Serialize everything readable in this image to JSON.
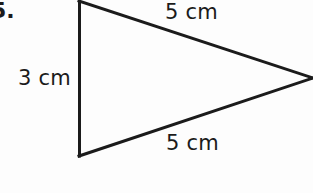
{
  "page": {
    "background_color": "#fdfdfd",
    "ink_color": "#1b1b1b"
  },
  "problem": {
    "number_label": "5.",
    "clipped_at_left_edge": true
  },
  "figure": {
    "shape_name": "triangle",
    "stroke_color": "#1b1b1b",
    "stroke_width": 3,
    "fill": "none",
    "vertices": {
      "top_left": {
        "x": 79,
        "y": 1
      },
      "bottom_left": {
        "x": 79,
        "y": 155
      },
      "right": {
        "x": 312,
        "y": 78
      }
    },
    "sides": [
      {
        "name": "top-side",
        "label": "5 cm",
        "from": "top_left",
        "to": "right"
      },
      {
        "name": "left-side",
        "label": "3 cm",
        "from": "top_left",
        "to": "bottom_left"
      },
      {
        "name": "bottom-side",
        "label": "5 cm",
        "from": "bottom_left",
        "to": "right"
      }
    ]
  },
  "labels": {
    "top": "5 cm",
    "left": "3 cm",
    "bottom": "5 cm"
  }
}
